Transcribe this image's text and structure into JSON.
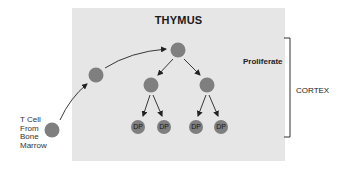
{
  "diagram": {
    "title": "THYMUS",
    "source_label": [
      "T Cell",
      "From",
      "Bone",
      "Marrow"
    ],
    "stage_label": "Proliferate",
    "region_label": "CORTEX",
    "dp_labels": [
      "DP",
      "DP",
      "DP",
      "DP"
    ],
    "colors": {
      "thymus_bg": "#e6e6e6",
      "cell": "#7f7f7f",
      "arrow": "#222222"
    }
  }
}
